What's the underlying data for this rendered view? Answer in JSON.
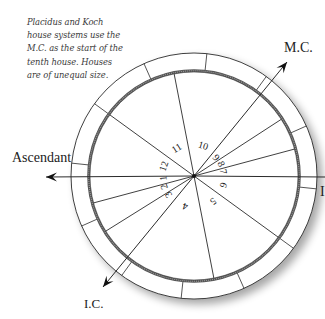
{
  "caption": {
    "lines": [
      "Placidus and Koch",
      "house systems use the",
      "M.C. as the start of the",
      "tenth house. Houses",
      "are of unequal size."
    ]
  },
  "axes": {
    "mc_label": "M.C.",
    "ascendant_label": "Ascendant",
    "ic_label": "I.C.",
    "descendant_label_visible": "I"
  },
  "wheel": {
    "center": [
      194,
      176
    ],
    "outer_radius": 123,
    "inner_radius": 104,
    "sign_cusp_angles_deg": [
      84,
      114,
      144,
      174,
      204,
      234,
      264,
      294,
      324,
      354,
      24,
      54
    ],
    "house_cusps": [
      {
        "house": "1",
        "angle_deg": 180,
        "label_angle_deg": 184,
        "label_r": 31
      },
      {
        "house": "2",
        "angle_deg": 195,
        "label_angle_deg": 200,
        "label_r": 32
      },
      {
        "house": "3",
        "angle_deg": 212,
        "label_angle_deg": 216,
        "label_r": 32
      },
      {
        "house": "4",
        "angle_deg": 230,
        "label_angle_deg": 254,
        "label_r": 32
      },
      {
        "house": "5",
        "angle_deg": 281,
        "label_angle_deg": 307,
        "label_r": 32
      },
      {
        "house": "6",
        "angle_deg": 324,
        "label_angle_deg": 343,
        "label_r": 31
      },
      {
        "house": "7",
        "angle_deg": 0,
        "label_angle_deg": 9,
        "label_r": 30
      },
      {
        "house": "8",
        "angle_deg": 15,
        "label_angle_deg": 24,
        "label_r": 30
      },
      {
        "house": "9",
        "angle_deg": 33,
        "label_angle_deg": 40,
        "label_r": 29
      },
      {
        "house": "10",
        "angle_deg": 50,
        "label_angle_deg": 73,
        "label_r": 32
      },
      {
        "house": "11",
        "angle_deg": 101,
        "label_angle_deg": 122,
        "label_r": 33
      },
      {
        "house": "12",
        "angle_deg": 144,
        "label_angle_deg": 162,
        "label_r": 32
      }
    ],
    "arrows": {
      "mc_tip": [
        287,
        62
      ],
      "ic_tip": [
        103,
        287
      ],
      "asc_tip": [
        46,
        177
      ],
      "dsc_end": [
        325,
        177
      ]
    }
  },
  "colors": {
    "line": "#2a2a2a",
    "ring_band": "#555555",
    "shadow": "#bdbdbd",
    "text": "#222222"
  }
}
